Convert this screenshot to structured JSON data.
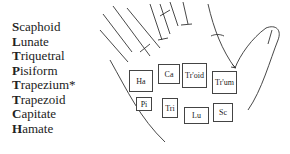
{
  "legend": [
    {
      "initial": "S",
      "rest": "caphoid"
    },
    {
      "initial": "L",
      "rest": "unate"
    },
    {
      "initial": "T",
      "rest": "riquetral"
    },
    {
      "initial": "P",
      "rest": "isiform"
    },
    {
      "initial": "T",
      "rest": "rapezium*"
    },
    {
      "initial": "T",
      "rest": "rapezoid"
    },
    {
      "initial": "C",
      "rest": "apitate"
    },
    {
      "initial": "H",
      "rest": "amate"
    }
  ],
  "bones": [
    {
      "label": "Ha",
      "x": 129,
      "y": 70,
      "w": 24,
      "h": 22
    },
    {
      "label": "Ca",
      "x": 158,
      "y": 64,
      "w": 22,
      "h": 20
    },
    {
      "label": "Tr'oid",
      "x": 182,
      "y": 63,
      "w": 25,
      "h": 25
    },
    {
      "label": "Tr'um",
      "x": 212,
      "y": 71,
      "w": 25,
      "h": 23
    },
    {
      "label": "Pi",
      "x": 136,
      "y": 97,
      "w": 16,
      "h": 14
    },
    {
      "label": "Tri",
      "x": 162,
      "y": 98,
      "w": 16,
      "h": 20
    },
    {
      "label": "Lu",
      "x": 184,
      "y": 107,
      "w": 25,
      "h": 17
    },
    {
      "label": "Sc",
      "x": 213,
      "y": 103,
      "w": 20,
      "h": 19
    }
  ]
}
